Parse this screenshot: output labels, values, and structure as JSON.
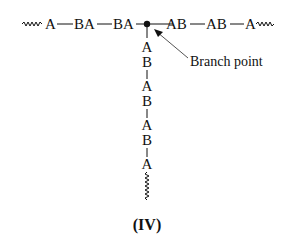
{
  "diagram": {
    "horizontal_chain": {
      "left_segment": [
        "A",
        "BA",
        "BA"
      ],
      "right_segment": [
        "AB",
        "AB",
        "A"
      ],
      "left_end": "wavy-chain-continuation",
      "right_end": "wavy-chain-continuation"
    },
    "vertical_chain": {
      "units": [
        "A",
        "B",
        "A",
        "B",
        "A",
        "B",
        "A"
      ],
      "bottom_end": "wavy-chain-continuation"
    },
    "branch_point_label": "Branch point",
    "caption": "(IV)",
    "colors": {
      "ink": "#111111",
      "arrow": "#555555",
      "background": "#ffffff"
    }
  }
}
